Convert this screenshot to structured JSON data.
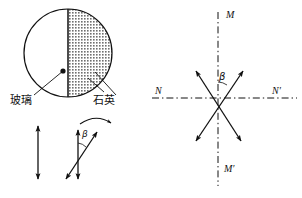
{
  "figure": {
    "background_color": "#ffffff",
    "stroke_color": "#111111",
    "hatch_color": "#6d6d6d"
  },
  "left_panel": {
    "disc": {
      "name": "half-glass-half-quartz-disc",
      "cx": 68,
      "cy": 53,
      "r": 44,
      "left_half_fill": "white",
      "right_half_fill": "hatched-gray",
      "divider_orientation": "vertical"
    },
    "callouts": [
      {
        "label": "玻璃",
        "meaning": "glass",
        "side": "left",
        "x": 10,
        "y": 95,
        "dot_x": 63,
        "dot_y": 71
      },
      {
        "label": "石英",
        "meaning": "quartz",
        "side": "right",
        "x": 93,
        "y": 95,
        "dot_x": 95,
        "dot_y": 72
      }
    ],
    "vectors": {
      "single_vertical": {
        "name": "vertical-double-arrow",
        "x": 38,
        "y_top": 124,
        "y_bottom": 181
      },
      "pair": {
        "name": "rotated-vector-pair",
        "vertical": {
          "x": 78,
          "y_top": 128,
          "y_bottom": 181
        },
        "tilted": {
          "x1": 65,
          "y1": 180,
          "x2": 98,
          "y2": 131
        },
        "angle_label": "β",
        "angle_label_x": 82,
        "angle_label_y": 130,
        "rotation_arrow": {
          "name": "clockwise-rotation-arrow",
          "from_x": 80,
          "from_y": 124,
          "to_x": 112,
          "to_y": 124
        }
      }
    }
  },
  "right_panel": {
    "origin": {
      "x": 218,
      "y": 98
    },
    "axes": [
      {
        "name": "vertical-axis-MM'",
        "style": "dash-dot",
        "x1": 218,
        "y1": 12,
        "x2": 218,
        "y2": 186
      },
      {
        "name": "horizontal-axis-NN'",
        "style": "dash-dot",
        "x1": 152,
        "y1": 98,
        "x2": 297,
        "y2": 98
      }
    ],
    "axis_labels": [
      {
        "name": "axis-label-M",
        "text": "M",
        "x": 226,
        "y": 10
      },
      {
        "name": "axis-label-M'",
        "text": "M′",
        "x": 224,
        "y": 164
      },
      {
        "name": "axis-label-N",
        "text": "N",
        "x": 155,
        "y": 86
      },
      {
        "name": "axis-label-N'",
        "text": "N′",
        "x": 272,
        "y": 86
      }
    ],
    "vectors": [
      {
        "name": "double-arrow-up-right",
        "x1": 194,
        "y1": 143,
        "x2": 245,
        "y2": 69
      },
      {
        "name": "double-arrow-up-left",
        "x1": 243,
        "y1": 143,
        "x2": 195,
        "y2": 69
      }
    ],
    "angle": {
      "name": "angle-beta",
      "label": "β",
      "label_x": 219,
      "label_y": 72,
      "between": [
        "vertical-axis-MM'",
        "double-arrow-up-right"
      ]
    }
  }
}
